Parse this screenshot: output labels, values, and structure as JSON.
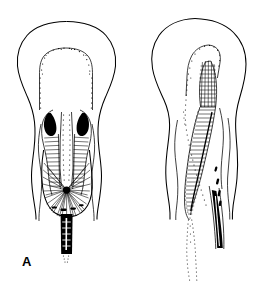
{
  "figure": {
    "kind": "scientific-line-drawing",
    "background_color": "#ffffff",
    "ink_color": "#000000",
    "width": 266,
    "height": 287,
    "panel_count": 2
  },
  "panels": [
    {
      "id": "A",
      "label": "A",
      "label_position": {
        "x": 22,
        "y": 255
      },
      "description": "Longitudinal section, symmetric bilobed form with stippled inner chamber, paired dark hatched lateral bodies, radiating fan of fine lines converging to a dark basal stalk",
      "features": {
        "outer_outline": "smooth dome with wavy descending lateral flaps",
        "inner_chamber": "stippled oval cavity, upper portion",
        "lateral_bodies": "two dense black hatched lobes flanking a central stippled canal",
        "basal_fan": "radiating fine striations converging at base",
        "stalk": "dark narrow vertical stalk with pale core"
      }
    },
    {
      "id": "B",
      "label": "B",
      "label_position": {
        "x": 161,
        "y": 255
      },
      "description": "Longitudinal section, asymmetric elongated form with a single slanted dense transversely hatched band, cross-hatched apex, dotted trailing margin and dark lateral stalk",
      "features": {
        "outer_outline": "smooth dome with wavy descending lateral flaps",
        "inner_chamber": "narrow stippled cavity, curved",
        "apex_mesh": "cross-hatched dark mesh at apex",
        "hatched_band": "elongated oblique band with dense transverse rungs",
        "dotted_trail": "fine dotted line extending below left",
        "stalk": "dark narrow stalk descending at right"
      }
    }
  ]
}
